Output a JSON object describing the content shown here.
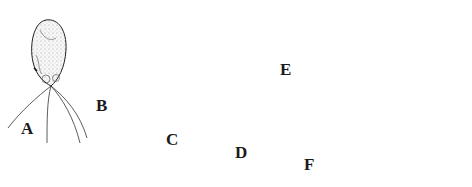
{
  "figure": {
    "panels": [
      {
        "id": "A",
        "label": "A",
        "description": "ovoid cell with flagella"
      },
      {
        "id": "B",
        "label": "B",
        "description": "ovoid cell with short basal appendages"
      },
      {
        "id": "C",
        "label": "C",
        "description": "two-celled club-shaped body"
      },
      {
        "id": "D",
        "label": "D",
        "description": "elongate curved four-celled body"
      },
      {
        "id": "E",
        "label": "E",
        "description": "filament segment with dividing cells and sporangium"
      },
      {
        "id": "F",
        "label": "F",
        "description": "paired flagellated cells"
      }
    ],
    "colors": {
      "stroke": "#222222",
      "stipple": "#555555",
      "background": "#ffffff"
    }
  }
}
